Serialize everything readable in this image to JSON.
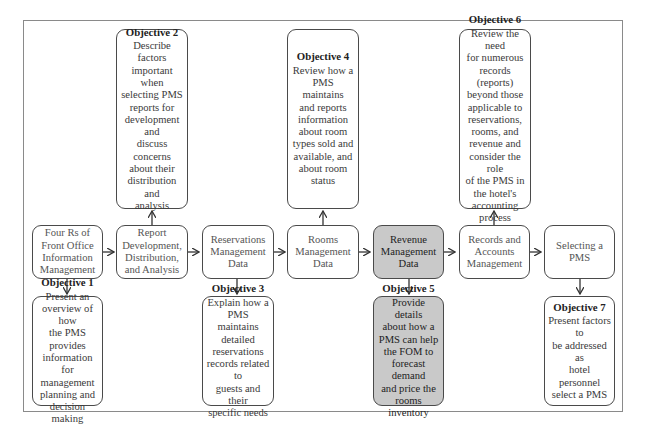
{
  "diagram": {
    "topics": [
      {
        "id": "four-rs",
        "label": "Four Rs of\nFront Office\nInformation\nManagement",
        "highlighted": false
      },
      {
        "id": "report-development",
        "label": "Report\nDevelopment,\nDistribution,\nand Analysis",
        "highlighted": false
      },
      {
        "id": "reservations",
        "label": "Reservations\nManagement\nData",
        "highlighted": false
      },
      {
        "id": "rooms",
        "label": "Rooms\nManagement\nData",
        "highlighted": false
      },
      {
        "id": "revenue",
        "label": "Revenue\nManagement\nData",
        "highlighted": true
      },
      {
        "id": "records",
        "label": "Records and\nAccounts\nManagement",
        "highlighted": false
      },
      {
        "id": "selecting",
        "label": "Selecting a\nPMS",
        "highlighted": false
      }
    ],
    "objectives": [
      {
        "title": "Objective 1",
        "body": "Present an\noverview of how\nthe PMS provides\ninformation for\nmanagement\nplanning and\ndecision making",
        "position": "below",
        "topic": "four-rs"
      },
      {
        "title": "Objective 2",
        "body": "Describe factors\nimportant when\nselecting PMS\nreports for\ndevelopment and\ndiscuss concerns\nabout their\ndistribution and\nanalysis",
        "position": "above",
        "topic": "report-development"
      },
      {
        "title": "Objective 3",
        "body": "Explain how a\nPMS maintains\ndetailed\nreservations\nrecords related to\nguests and their\nspecific needs",
        "position": "below",
        "topic": "reservations"
      },
      {
        "title": "Objective 4",
        "body": "Review how a\nPMS maintains\nand reports\ninformation\nabout room\ntypes sold and\navailable, and\nabout room\nstatus",
        "position": "above",
        "topic": "rooms"
      },
      {
        "title": "Objective 5",
        "body": "Provide details\nabout how a\nPMS can help\nthe FOM to\nforecast demand\nand price the\nrooms inventory",
        "position": "below",
        "topic": "revenue",
        "highlighted": true
      },
      {
        "title": "Objective 6",
        "body": "Review the need\nfor numerous\nrecords (reports)\nbeyond those\napplicable to\nreservations,\nrooms, and\nrevenue and\nconsider the role\nof the PMS in\nthe hotel's\naccounting\nprocess",
        "position": "above",
        "topic": "records"
      },
      {
        "title": "Objective 7",
        "body": "Present factors to\nbe addressed as\nhotel personnel\nselect a PMS",
        "position": "below",
        "topic": "selecting"
      }
    ],
    "colors": {
      "border": "#4a4a4a",
      "frame": "#8a8a8a",
      "highlight_fill": "#c9c9c9"
    }
  }
}
